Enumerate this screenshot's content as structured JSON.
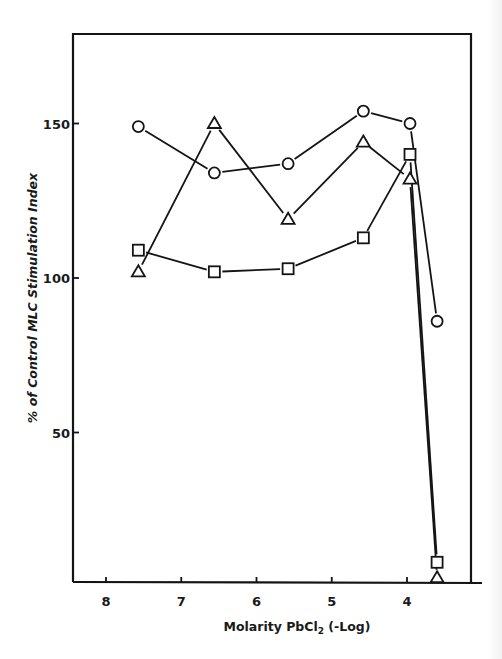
{
  "chart_data": {
    "type": "line",
    "title": "",
    "xlabel": "Molarity PbCl₂ (-Log)",
    "ylabel": "% of Control MLC Stimulation Index",
    "x_reversed": true,
    "xlim": [
      8.45,
      3.1
    ],
    "ylim": [
      2,
      180
    ],
    "x_ticks": [
      "8",
      "7",
      "6",
      "5",
      "4"
    ],
    "y_ticks": [
      "50",
      "100",
      "150"
    ],
    "grid": false,
    "legend": "none",
    "series": [
      {
        "name": "circle",
        "marker": "circle",
        "x": [
          7.57,
          6.56,
          5.58,
          4.58,
          3.96,
          3.6
        ],
        "values": [
          149,
          134,
          137,
          154,
          150,
          86
        ]
      },
      {
        "name": "triangle",
        "marker": "triangle",
        "x": [
          7.57,
          6.56,
          5.58,
          4.58,
          3.96,
          3.6
        ],
        "values": [
          102,
          150,
          119,
          144,
          132,
          3
        ]
      },
      {
        "name": "square",
        "marker": "square",
        "x": [
          7.57,
          6.56,
          5.58,
          4.58,
          3.96,
          3.6
        ],
        "values": [
          109,
          102,
          103,
          113,
          140,
          8
        ]
      }
    ]
  },
  "labels": {
    "x_title_main": "Molarity PbCl",
    "x_title_sub": "2",
    "x_title_tail": " (-Log)",
    "y_title": "% of Control MLC Stimulation Index"
  },
  "colors": {
    "ink": "#141414",
    "background": "#ffffff"
  }
}
